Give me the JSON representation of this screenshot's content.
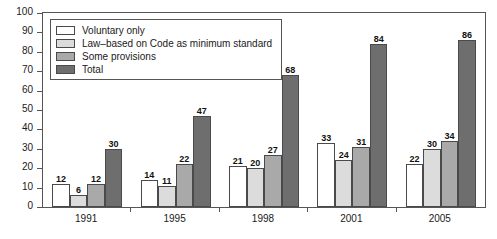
{
  "chart_data": {
    "type": "bar",
    "title": "",
    "subtitle": "",
    "xlabel": "",
    "ylabel": "",
    "categories": [
      "1991",
      "1995",
      "1998",
      "2001",
      "2005"
    ],
    "series": [
      {
        "name": "Voluntary only",
        "color": "#ffffff",
        "values": [
          12,
          14,
          21,
          33,
          22
        ]
      },
      {
        "name": "Law–based on Code as minimum standard",
        "color": "#dcdcdc",
        "values": [
          6,
          11,
          20,
          24,
          30
        ]
      },
      {
        "name": "Some provisions",
        "color": "#a9a9a9",
        "values": [
          12,
          22,
          27,
          31,
          34
        ]
      },
      {
        "name": "Total",
        "color": "#6e6e6e",
        "values": [
          30,
          47,
          68,
          84,
          86
        ]
      }
    ],
    "ylim": [
      0,
      100
    ],
    "yticks": [
      0,
      10,
      20,
      30,
      40,
      50,
      60,
      70,
      80,
      90,
      100
    ],
    "grid": false,
    "legend_position": "top-left",
    "show_value_labels": true
  }
}
